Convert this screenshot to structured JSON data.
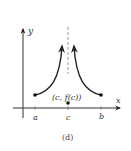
{
  "figure": {
    "caption": "(d)",
    "axes": {
      "x_label": "x",
      "y_label": "y"
    },
    "tick_labels": {
      "a": "a",
      "c": "c",
      "b": "b"
    },
    "point_label": "(c, f(c))",
    "colors": {
      "curve": "#222222",
      "axis": "#333333",
      "asymptote": "#999999"
    }
  }
}
